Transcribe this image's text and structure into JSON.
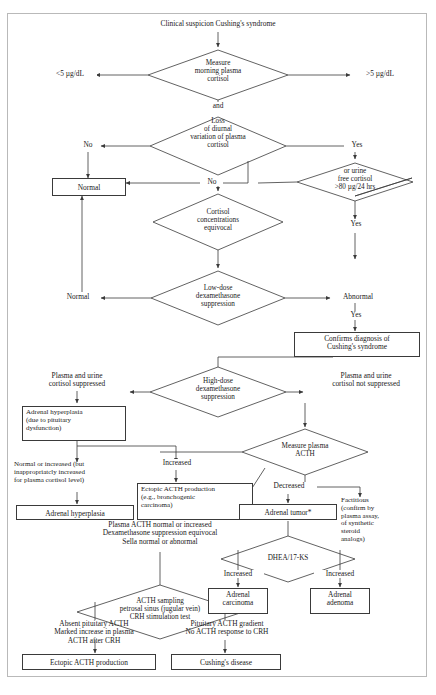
{
  "diagram": {
    "title": "Clinical suspicion Cushing's syndrome",
    "type": "clinical-algorithm-flowchart",
    "colors": {
      "stroke": "#3a3a3a",
      "text": "#1a1a1a",
      "frame": "#b9b9b9",
      "background": "#ffffff"
    },
    "nodes": {
      "start": "Clinical suspicion Cushing's syndrome",
      "d_morning_cortisol": "Measure\nmorning plasma\ncortisol",
      "lbl_lt5": "<5 µg/dL",
      "lbl_gt5": ">5 µg/dL",
      "lbl_and": "and",
      "d_diurnal": "Loss\nof diurnal\nvariation of plasma\ncortisol",
      "lbl_no_left": "No",
      "lbl_yes_right": "Yes",
      "box_normal_1": "Normal",
      "lbl_no_mid": "No",
      "d_urine_free_cortisol": "or urine\nfree cortisol\n>80 µg/24 hrs",
      "lbl_yes_urine": "Yes",
      "d_cortisol_equivocal": "Cortisol\nconcentrations\nequivocal",
      "d_lowdose_dex": "Low-dose\ndexamethasone\nsuppression",
      "lbl_normal_2": "Normal",
      "lbl_abnormal": "Abnormal",
      "lbl_yes_abnormal": "Yes",
      "box_confirms": "Confirms diagnosis of\nCushing's syndrome",
      "d_highdose_dex": "High-dose\ndexamethasone\nsuppression",
      "lbl_suppressed": "Plasma and urine\ncortisol suppressed",
      "lbl_not_suppressed": "Plasma and urine\ncortisol not suppressed",
      "box_adrenal_hyperplasia_pit": "Adrenal hyperplasia\n(due to pituitary\ndysfunction)",
      "d_measure_acth": "Measure plasma\nACTH",
      "lbl_normal_increased": "Normal or increased (but\ninappropriatcly increased\nfor plasma cortisol level)",
      "lbl_increased_ectopic": "Increased",
      "lbl_decreased": "Decreased",
      "box_adrenal_hyperplasia": "Adrenal hyperplasia",
      "box_ectopic_acth": "Ectopic ACTH production\n(e.g., bronchogenic\ncarcinoma)",
      "box_adrenal_tumor": "Adrenal tumor*",
      "lbl_factitious": "Factitious\n(confirm by\nplasma assay,\nof synthetic\nsteroid\nanalogs)",
      "lbl_acth_equivocal": "Plasma ACTH normal or increased\nDexamethasone suppression equivocal\nSella normal or abnormal",
      "d_dhea": "DHEA/17-KS",
      "lbl_increased_carcinoma": "Increased",
      "lbl_increased_adenoma": "Increased",
      "box_adrenal_carcinoma": "Adrenal\ncarcinoma",
      "box_adrenal_adenoma": "Adrenal\nadenoma",
      "d_acth_sampling": "ACTH sampling\npetrosal sinus (jugular vein)\nCRH stimulation test",
      "lbl_absent_pit_acth": "Absent pituitary ACTH\nMarked increase in plasma\nACTH after CRH",
      "lbl_pit_gradient": "Pituitary ACTH gradient\nNo ACTH response to CRH",
      "box_ectopic_acth_production": "Ectopic ACTH production",
      "box_cushings_disease": "Cushing's disease"
    }
  }
}
